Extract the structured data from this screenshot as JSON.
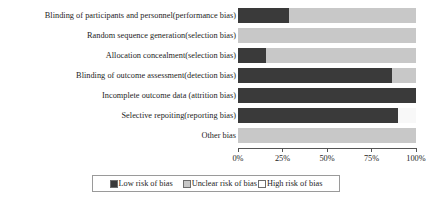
{
  "chart_data": {
    "type": "bar",
    "orientation": "horizontal",
    "stacked": true,
    "normalized_percent": true,
    "title": "",
    "xlabel": "",
    "ylabel": "",
    "xlim": [
      0,
      100
    ],
    "grid": false,
    "legend_position": "bottom",
    "categories": [
      "Blinding of participants and personnel(performance bias)",
      "Random sequence generation(selection bias)",
      "Allocation concealment(selection bias)",
      "Blinding of outcome assessment(detection bias)",
      "Incomplete outcome data (attrition bias)",
      "Selective repoiting(reporting bias)",
      "Other bias"
    ],
    "series": [
      {
        "name": "Low risk of bias",
        "color": "#3a3a3a",
        "values": [
          28.6,
          0,
          16,
          86.5,
          100,
          90,
          0
        ]
      },
      {
        "name": "Unclear risk of bias",
        "color": "#c8c8c8",
        "values": [
          71.4,
          100,
          84,
          13.5,
          0,
          0,
          100
        ]
      },
      {
        "name": "High risk of bias",
        "color": "#f8f8f8",
        "values": [
          0,
          0,
          0,
          0,
          0,
          10,
          0
        ]
      }
    ],
    "xticks": [
      0,
      25,
      50,
      75,
      100
    ],
    "xtick_labels": [
      "0%",
      "25%",
      "50%",
      "75%",
      "100%"
    ]
  },
  "legend": {
    "items": [
      {
        "label": "Low risk of bias",
        "key": "low"
      },
      {
        "label": "Unclear risk of bias",
        "key": "unclear"
      },
      {
        "label": "High risk of bias",
        "key": "high"
      }
    ]
  }
}
